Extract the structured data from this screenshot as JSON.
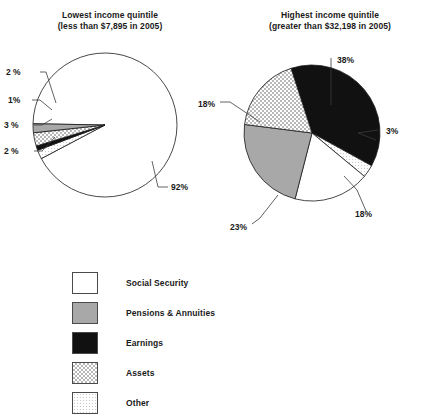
{
  "chart_data": [
    {
      "type": "pie",
      "id": "lowest",
      "title": "Lowest income quintile",
      "subtitle": "(less than $7,895 in 2005)",
      "categories": [
        "Social Security",
        "Pensions & Annuities",
        "Earnings",
        "Assets",
        "Other"
      ],
      "values": [
        92,
        2,
        1,
        3,
        2
      ],
      "labels": [
        "92%",
        "2 %",
        "1%",
        "3 %",
        "2 %"
      ],
      "legend_position": "bottom-left",
      "grid": false,
      "xlabel": "",
      "ylabel": ""
    },
    {
      "type": "pie",
      "id": "highest",
      "title": "Highest income quintile",
      "subtitle": "(greater than $32,198 in 2005)",
      "categories": [
        "Social Security",
        "Pensions & Annuities",
        "Earnings",
        "Assets",
        "Other"
      ],
      "values": [
        18,
        23,
        38,
        18,
        3
      ],
      "labels": [
        "18%",
        "23%",
        "38%",
        "18%",
        "3%"
      ],
      "legend_position": "bottom-left",
      "grid": false,
      "xlabel": "",
      "ylabel": ""
    }
  ],
  "legend": {
    "items": [
      {
        "label": "Social Security",
        "pattern": "solid-white",
        "color": "#ffffff"
      },
      {
        "label": "Pensions & Annuities",
        "pattern": "solid-gray",
        "color": "#a8a8a8"
      },
      {
        "label": "Earnings",
        "pattern": "solid-black",
        "color": "#111111"
      },
      {
        "label": "Assets",
        "pattern": "checker-medium",
        "color": "#cfcfcf"
      },
      {
        "label": "Other",
        "pattern": "dots-light",
        "color": "#ededed"
      }
    ]
  }
}
